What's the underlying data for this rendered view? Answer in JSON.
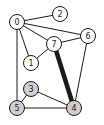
{
  "diagram": {
    "type": "undirected-graph",
    "colors": {
      "node_default": "#ffffff",
      "node_highlighted": "#cfcfcf",
      "stroke": "#1a1a1a",
      "background": "#ffffff"
    },
    "node_radius": 7.5,
    "nodes": [
      {
        "id": "0",
        "label": "0",
        "x": 17,
        "y": 22,
        "highlighted": false
      },
      {
        "id": "1",
        "label": "1",
        "x": 31,
        "y": 63,
        "highlighted": false
      },
      {
        "id": "2",
        "label": "2",
        "x": 60,
        "y": 14,
        "highlighted": false
      },
      {
        "id": "3",
        "label": "3",
        "x": 31,
        "y": 89,
        "highlighted": true
      },
      {
        "id": "4",
        "label": "4",
        "x": 74,
        "y": 108,
        "highlighted": true
      },
      {
        "id": "5",
        "label": "5",
        "x": 17,
        "y": 108,
        "highlighted": true
      },
      {
        "id": "6",
        "label": "6",
        "x": 88,
        "y": 36,
        "highlighted": false
      },
      {
        "id": "7",
        "label": "7",
        "x": 54,
        "y": 44,
        "highlighted": false
      }
    ],
    "edges": [
      {
        "from": "0",
        "to": "2",
        "thick": false
      },
      {
        "from": "0",
        "to": "6",
        "thick": false
      },
      {
        "from": "0",
        "to": "7",
        "thick": false
      },
      {
        "from": "0",
        "to": "1",
        "thick": false
      },
      {
        "from": "0",
        "to": "5",
        "thick": false
      },
      {
        "from": "7",
        "to": "6",
        "thick": false
      },
      {
        "from": "7",
        "to": "1",
        "thick": false
      },
      {
        "from": "7",
        "to": "4",
        "thick": true
      },
      {
        "from": "6",
        "to": "4",
        "thick": false
      },
      {
        "from": "3",
        "to": "5",
        "thick": false
      },
      {
        "from": "3",
        "to": "4",
        "thick": false
      },
      {
        "from": "5",
        "to": "4",
        "thick": false
      }
    ]
  }
}
